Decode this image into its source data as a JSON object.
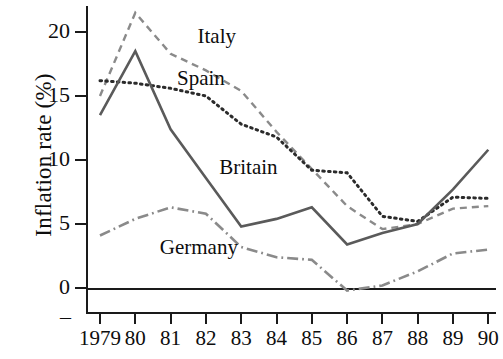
{
  "chart_data": {
    "type": "line",
    "title": "",
    "xlabel": "",
    "ylabel": "Inflation rate (%)",
    "categories": [
      "1979",
      "80",
      "81",
      "82",
      "83",
      "84",
      "85",
      "86",
      "87",
      "88",
      "89",
      "90"
    ],
    "x_tick_labels": [
      "1979",
      "80",
      "81",
      "82",
      "83",
      "84",
      "85",
      "86",
      "87",
      "88",
      "89",
      "90"
    ],
    "y_tick_labels": [
      "0",
      "5",
      "10",
      "15",
      "20"
    ],
    "y_ticks": [
      0,
      5,
      10,
      15,
      20
    ],
    "ylim": [
      -1.5,
      22.5
    ],
    "xlim": [
      "1979",
      "90"
    ],
    "grid": false,
    "legend_position": "inline-annotations",
    "series": [
      {
        "name": "Italy",
        "style": "dashed",
        "color": "#8a8a8a",
        "values": [
          15.0,
          21.5,
          18.3,
          17.0,
          15.4,
          12.2,
          9.3,
          6.4,
          4.6,
          5.0,
          6.2,
          6.4
        ]
      },
      {
        "name": "Spain",
        "style": "dotted",
        "color": "#2b2b2b",
        "values": [
          16.2,
          16.0,
          15.6,
          15.0,
          12.8,
          11.8,
          9.2,
          9.0,
          5.6,
          5.2,
          7.1,
          7.0
        ]
      },
      {
        "name": "Britain",
        "style": "solid",
        "color": "#5a5a5a",
        "values": [
          13.5,
          18.5,
          12.4,
          8.6,
          4.8,
          5.4,
          6.3,
          3.4,
          4.3,
          5.0,
          7.7,
          10.8
        ]
      },
      {
        "name": "Germany",
        "style": "dashdot",
        "color": "#8a8a8a",
        "values": [
          4.1,
          5.4,
          6.3,
          5.8,
          3.2,
          2.4,
          2.2,
          -0.2,
          0.2,
          1.3,
          2.7,
          3.0
        ]
      }
    ],
    "annotations": [
      {
        "text": "Italy",
        "x_frac": 0.272,
        "y_value": 19.6
      },
      {
        "text": "Spain",
        "x_frac": 0.222,
        "y_value": 16.3
      },
      {
        "text": "Britain",
        "x_frac": 0.325,
        "y_value": 9.4
      },
      {
        "text": "Germany",
        "x_frac": 0.18,
        "y_value": 3.1
      }
    ]
  },
  "axis": {
    "y_title": "Inflation rate (%)",
    "minus_mark": "–"
  }
}
